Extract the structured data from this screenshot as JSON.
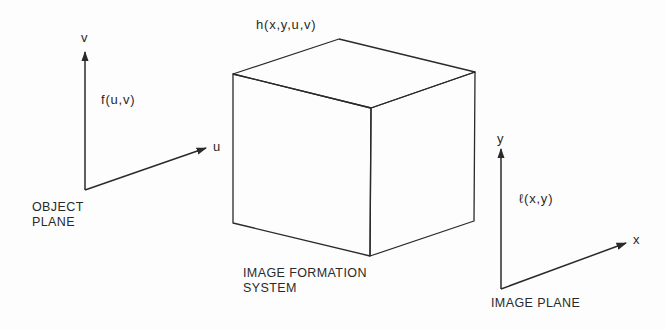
{
  "diagram": {
    "type": "block-diagram",
    "subject": "Image formation system",
    "colors": {
      "line": "#2a2a2a",
      "background": "#fdfdfd"
    },
    "object_plane": {
      "axis_vertical_label": "v",
      "axis_horizontal_label": "u",
      "function_label": "f(u,v)",
      "caption_line1": "OBJECT",
      "caption_line2": "PLANE"
    },
    "system": {
      "shape": "cube",
      "function_label": "h(x,y,u,v)",
      "caption_line1": "IMAGE FORMATION",
      "caption_line2": "SYSTEM"
    },
    "image_plane": {
      "axis_vertical_label": "y",
      "axis_horizontal_label": "x",
      "function_label": "ℓ(x,y)",
      "caption": "IMAGE PLANE"
    }
  }
}
